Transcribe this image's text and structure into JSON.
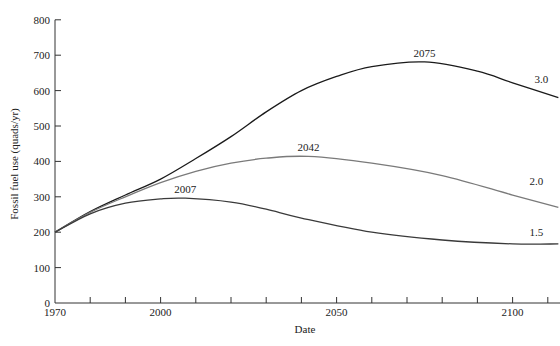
{
  "chart_data": {
    "type": "line",
    "title": "",
    "xlabel": "Date",
    "ylabel": "Fossil fuel use (quads/yr)",
    "xlim": [
      1970,
      2113
    ],
    "ylim": [
      0,
      800
    ],
    "x_ticks": [
      1970,
      1980,
      1990,
      2000,
      2010,
      2020,
      2030,
      2040,
      2050,
      2060,
      2070,
      2080,
      2090,
      2100,
      2110
    ],
    "x_tick_labels": [
      "1970",
      "2000",
      "2050",
      "2100"
    ],
    "x_tick_label_values": [
      1970,
      2000,
      2050,
      2100
    ],
    "y_ticks": [
      0,
      100,
      200,
      300,
      400,
      500,
      600,
      700,
      800
    ],
    "y_tick_labels": [
      "0",
      "100",
      "200",
      "300",
      "400",
      "500",
      "600",
      "700",
      "800"
    ],
    "grid": false,
    "legend": "inline labels at right end of each curve",
    "series": [
      {
        "name": "3.0",
        "color": "#1a1a1a",
        "peak_label": "2075",
        "peak": [
          2075,
          681
        ],
        "x": [
          1970,
          1980,
          1990,
          2000,
          2010,
          2020,
          2030,
          2040,
          2050,
          2060,
          2075,
          2090,
          2100,
          2113
        ],
        "values": [
          200,
          258,
          305,
          350,
          408,
          470,
          540,
          600,
          640,
          668,
          681,
          655,
          622,
          580
        ]
      },
      {
        "name": "2.0",
        "color": "#7a7a7a",
        "peak_label": "2042",
        "peak": [
          2042,
          414
        ],
        "x": [
          1970,
          1980,
          1990,
          2000,
          2010,
          2020,
          2030,
          2042,
          2060,
          2080,
          2100,
          2113
        ],
        "values": [
          200,
          256,
          300,
          340,
          372,
          395,
          409,
          414,
          395,
          360,
          305,
          270
        ]
      },
      {
        "name": "1.5",
        "color": "#3a3a3a",
        "peak_label": "2007",
        "peak": [
          2007,
          296
        ],
        "x": [
          1970,
          1980,
          1990,
          2000,
          2007,
          2020,
          2030,
          2040,
          2060,
          2080,
          2100,
          2113
        ],
        "values": [
          200,
          252,
          282,
          294,
          296,
          285,
          265,
          240,
          200,
          178,
          167,
          167
        ]
      }
    ]
  },
  "labels": {
    "ylabel": "Fossil fuel use (quads/yr)",
    "xlabel": "Date"
  }
}
